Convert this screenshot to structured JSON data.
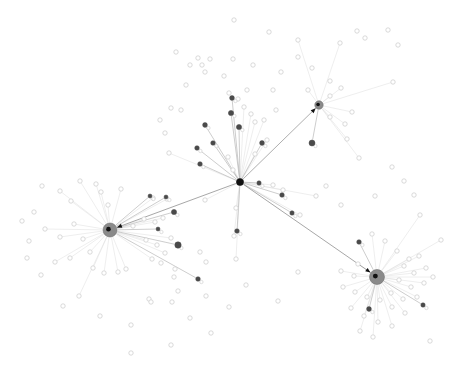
{
  "figure": {
    "title": "",
    "background": "#ffffff",
    "width": 453,
    "height": 379
  },
  "palette": {
    "hub_fill": "#8a8a8a",
    "hub_stroke": "#6f6f6f",
    "core_fill": "#111111",
    "dark_node_fill": "#4a4a4a",
    "mid_node_fill": "#9a9a9a",
    "leaf_stroke": "#cfcfcf",
    "leaf_fill": "#ffffff",
    "edge_strong": "#6b6b6b",
    "edge_medium": "#b8b8b8",
    "edge_faint": "#e0e0e0"
  },
  "chart_data": {
    "type": "scatter",
    "title": "",
    "xlabel": "",
    "ylabel": "",
    "xlim": [
      0,
      453
    ],
    "ylim": [
      0,
      379
    ],
    "grid": false,
    "legend": "none",
    "annotations": [],
    "node_counts": {
      "hubs": 4,
      "mid": 22,
      "leaves": 148
    },
    "hubs": [
      {
        "id": "H0",
        "label": "",
        "x": 240,
        "y": 182,
        "r": 3.6,
        "kind": "core",
        "degree": 34
      },
      {
        "id": "H1",
        "label": "",
        "x": 110,
        "y": 230,
        "r": 7.0,
        "kind": "hub",
        "degree": 24
      },
      {
        "id": "H2",
        "label": "",
        "x": 377,
        "y": 277,
        "r": 7.5,
        "kind": "hub",
        "degree": 33
      },
      {
        "id": "H3",
        "label": "",
        "x": 319,
        "y": 105,
        "r": 4.2,
        "kind": "hub",
        "degree": 7
      }
    ],
    "strong_edges": [
      {
        "source": "H0",
        "target": "H1",
        "weight": 3
      },
      {
        "source": "H0",
        "target": "H2",
        "weight": 3
      },
      {
        "source": "H0",
        "target": "H3",
        "weight": 2
      }
    ],
    "mid_nodes": [
      {
        "x": 205,
        "y": 125,
        "r": 2.4
      },
      {
        "x": 197,
        "y": 148,
        "r": 2.3
      },
      {
        "x": 213,
        "y": 143,
        "r": 2.3
      },
      {
        "x": 231,
        "y": 113,
        "r": 2.6
      },
      {
        "x": 232,
        "y": 98,
        "r": 2.4
      },
      {
        "x": 239,
        "y": 127,
        "r": 2.6
      },
      {
        "x": 262,
        "y": 143,
        "r": 2.4
      },
      {
        "x": 200,
        "y": 164,
        "r": 2.3
      },
      {
        "x": 259,
        "y": 183,
        "r": 2.2
      },
      {
        "x": 282,
        "y": 195,
        "r": 2.3
      },
      {
        "x": 312,
        "y": 143,
        "r": 3.0
      },
      {
        "x": 174,
        "y": 212,
        "r": 2.6
      },
      {
        "x": 178,
        "y": 245,
        "r": 3.2
      },
      {
        "x": 237,
        "y": 231,
        "r": 2.3
      },
      {
        "x": 198,
        "y": 279,
        "r": 2.3
      },
      {
        "x": 158,
        "y": 229,
        "r": 2.0
      },
      {
        "x": 292,
        "y": 213,
        "r": 2.2
      },
      {
        "x": 359,
        "y": 242,
        "r": 2.3
      },
      {
        "x": 369,
        "y": 309,
        "r": 2.4
      },
      {
        "x": 423,
        "y": 305,
        "r": 2.2
      },
      {
        "x": 166,
        "y": 197,
        "r": 2.0
      },
      {
        "x": 150,
        "y": 196,
        "r": 2.0
      }
    ],
    "leaf_nodes": [
      {
        "x": 234,
        "y": 20,
        "parent": "H0"
      },
      {
        "x": 269,
        "y": 32,
        "parent": "H0"
      },
      {
        "x": 176,
        "y": 52,
        "parent": "H0"
      },
      {
        "x": 198,
        "y": 58,
        "parent": "H0"
      },
      {
        "x": 202,
        "y": 65,
        "parent": "H0"
      },
      {
        "x": 210,
        "y": 59,
        "parent": "H0"
      },
      {
        "x": 190,
        "y": 65,
        "parent": "H0"
      },
      {
        "x": 233,
        "y": 59,
        "parent": "H0"
      },
      {
        "x": 253,
        "y": 65,
        "parent": "H0"
      },
      {
        "x": 205,
        "y": 72,
        "parent": "H0"
      },
      {
        "x": 224,
        "y": 76,
        "parent": "H0"
      },
      {
        "x": 186,
        "y": 85,
        "parent": "H0"
      },
      {
        "x": 171,
        "y": 108,
        "parent": "H0"
      },
      {
        "x": 181,
        "y": 110,
        "parent": "H0"
      },
      {
        "x": 160,
        "y": 120,
        "parent": "H0"
      },
      {
        "x": 165,
        "y": 133,
        "parent": "H0"
      },
      {
        "x": 169,
        "y": 153,
        "parent": "H0"
      },
      {
        "x": 229,
        "y": 93,
        "parent": "H0"
      },
      {
        "x": 238,
        "y": 99,
        "parent": "H0"
      },
      {
        "x": 247,
        "y": 90,
        "parent": "H0"
      },
      {
        "x": 244,
        "y": 107,
        "parent": "H0"
      },
      {
        "x": 251,
        "y": 114,
        "parent": "H0"
      },
      {
        "x": 255,
        "y": 122,
        "parent": "H0"
      },
      {
        "x": 264,
        "y": 120,
        "parent": "H0"
      },
      {
        "x": 276,
        "y": 110,
        "parent": "H0"
      },
      {
        "x": 273,
        "y": 90,
        "parent": "H0"
      },
      {
        "x": 281,
        "y": 72,
        "parent": "H0"
      },
      {
        "x": 298,
        "y": 57,
        "parent": "H0"
      },
      {
        "x": 312,
        "y": 68,
        "parent": "H0"
      },
      {
        "x": 330,
        "y": 81,
        "parent": "H0"
      },
      {
        "x": 340,
        "y": 43,
        "parent": "H3"
      },
      {
        "x": 357,
        "y": 31,
        "parent": "H3"
      },
      {
        "x": 365,
        "y": 38,
        "parent": "H3"
      },
      {
        "x": 388,
        "y": 30,
        "parent": "H3"
      },
      {
        "x": 298,
        "y": 40,
        "parent": "H3"
      },
      {
        "x": 308,
        "y": 90,
        "parent": "H3"
      },
      {
        "x": 330,
        "y": 96,
        "parent": "H3"
      },
      {
        "x": 341,
        "y": 88,
        "parent": "H3"
      },
      {
        "x": 330,
        "y": 117,
        "parent": "H3"
      },
      {
        "x": 345,
        "y": 124,
        "parent": "H3"
      },
      {
        "x": 352,
        "y": 112,
        "parent": "H3"
      },
      {
        "x": 347,
        "y": 139,
        "parent": "H3"
      },
      {
        "x": 359,
        "y": 158,
        "parent": "H3"
      },
      {
        "x": 393,
        "y": 82,
        "parent": "H3"
      },
      {
        "x": 398,
        "y": 45,
        "parent": "H3"
      },
      {
        "x": 255,
        "y": 154,
        "parent": "H0"
      },
      {
        "x": 267,
        "y": 140,
        "parent": "H0"
      },
      {
        "x": 228,
        "y": 157,
        "parent": "H0"
      },
      {
        "x": 233,
        "y": 170,
        "parent": "H0"
      },
      {
        "x": 273,
        "y": 185,
        "parent": "H0"
      },
      {
        "x": 283,
        "y": 190,
        "parent": "H0"
      },
      {
        "x": 300,
        "y": 215,
        "parent": "H0"
      },
      {
        "x": 234,
        "y": 236,
        "parent": "H0"
      },
      {
        "x": 236,
        "y": 208,
        "parent": "H0"
      },
      {
        "x": 205,
        "y": 200,
        "parent": "H0"
      },
      {
        "x": 167,
        "y": 199,
        "parent": "H1"
      },
      {
        "x": 153,
        "y": 198,
        "parent": "H1"
      },
      {
        "x": 144,
        "y": 219,
        "parent": "H1"
      },
      {
        "x": 155,
        "y": 222,
        "parent": "H1"
      },
      {
        "x": 163,
        "y": 218,
        "parent": "H1"
      },
      {
        "x": 133,
        "y": 226,
        "parent": "H1"
      },
      {
        "x": 146,
        "y": 240,
        "parent": "H1"
      },
      {
        "x": 157,
        "y": 245,
        "parent": "H1"
      },
      {
        "x": 171,
        "y": 238,
        "parent": "H1"
      },
      {
        "x": 165,
        "y": 253,
        "parent": "H1"
      },
      {
        "x": 152,
        "y": 259,
        "parent": "H1"
      },
      {
        "x": 96,
        "y": 184,
        "parent": "H1"
      },
      {
        "x": 80,
        "y": 181,
        "parent": "H1"
      },
      {
        "x": 101,
        "y": 192,
        "parent": "H1"
      },
      {
        "x": 71,
        "y": 201,
        "parent": "H1"
      },
      {
        "x": 60,
        "y": 191,
        "parent": "H1"
      },
      {
        "x": 42,
        "y": 186,
        "parent": "H1"
      },
      {
        "x": 34,
        "y": 212,
        "parent": "H1"
      },
      {
        "x": 22,
        "y": 221,
        "parent": "H1"
      },
      {
        "x": 29,
        "y": 241,
        "parent": "H1"
      },
      {
        "x": 45,
        "y": 229,
        "parent": "H1"
      },
      {
        "x": 60,
        "y": 237,
        "parent": "H1"
      },
      {
        "x": 74,
        "y": 224,
        "parent": "H1"
      },
      {
        "x": 83,
        "y": 239,
        "parent": "H1"
      },
      {
        "x": 90,
        "y": 252,
        "parent": "H1"
      },
      {
        "x": 70,
        "y": 258,
        "parent": "H1"
      },
      {
        "x": 55,
        "y": 262,
        "parent": "H1"
      },
      {
        "x": 41,
        "y": 275,
        "parent": "H1"
      },
      {
        "x": 27,
        "y": 258,
        "parent": "H1"
      },
      {
        "x": 93,
        "y": 268,
        "parent": "H1"
      },
      {
        "x": 104,
        "y": 273,
        "parent": "H1"
      },
      {
        "x": 118,
        "y": 272,
        "parent": "H1"
      },
      {
        "x": 126,
        "y": 269,
        "parent": "H1"
      },
      {
        "x": 108,
        "y": 205,
        "parent": "H1"
      },
      {
        "x": 121,
        "y": 189,
        "parent": "H1"
      },
      {
        "x": 63,
        "y": 306,
        "parent": "H1"
      },
      {
        "x": 79,
        "y": 296,
        "parent": "H1"
      },
      {
        "x": 100,
        "y": 316,
        "parent": "H1"
      },
      {
        "x": 131,
        "y": 325,
        "parent": "H1"
      },
      {
        "x": 149,
        "y": 299,
        "parent": "H1"
      },
      {
        "x": 151,
        "y": 302,
        "parent": "H1"
      },
      {
        "x": 172,
        "y": 302,
        "parent": "H1"
      },
      {
        "x": 178,
        "y": 291,
        "parent": "H1"
      },
      {
        "x": 190,
        "y": 318,
        "parent": "H1"
      },
      {
        "x": 206,
        "y": 296,
        "parent": "H1"
      },
      {
        "x": 131,
        "y": 353,
        "parent": "H1"
      },
      {
        "x": 171,
        "y": 345,
        "parent": "H1"
      },
      {
        "x": 211,
        "y": 333,
        "parent": "H1"
      },
      {
        "x": 229,
        "y": 307,
        "parent": "H0"
      },
      {
        "x": 200,
        "y": 252,
        "parent": "H0"
      },
      {
        "x": 206,
        "y": 262,
        "parent": "H0"
      },
      {
        "x": 175,
        "y": 269,
        "parent": "H0"
      },
      {
        "x": 174,
        "y": 277,
        "parent": "H0"
      },
      {
        "x": 161,
        "y": 263,
        "parent": "H0"
      },
      {
        "x": 246,
        "y": 285,
        "parent": "H0"
      },
      {
        "x": 278,
        "y": 301,
        "parent": "H0"
      },
      {
        "x": 236,
        "y": 259,
        "parent": "H0"
      },
      {
        "x": 298,
        "y": 272,
        "parent": "H0"
      },
      {
        "x": 316,
        "y": 196,
        "parent": "H0"
      },
      {
        "x": 326,
        "y": 186,
        "parent": "H0"
      },
      {
        "x": 341,
        "y": 205,
        "parent": "H0"
      },
      {
        "x": 375,
        "y": 196,
        "parent": "H2"
      },
      {
        "x": 392,
        "y": 167,
        "parent": "H2"
      },
      {
        "x": 404,
        "y": 181,
        "parent": "H2"
      },
      {
        "x": 414,
        "y": 195,
        "parent": "H2"
      },
      {
        "x": 420,
        "y": 215,
        "parent": "H2"
      },
      {
        "x": 372,
        "y": 234,
        "parent": "H2"
      },
      {
        "x": 385,
        "y": 241,
        "parent": "H2"
      },
      {
        "x": 397,
        "y": 251,
        "parent": "H2"
      },
      {
        "x": 409,
        "y": 259,
        "parent": "H2"
      },
      {
        "x": 419,
        "y": 256,
        "parent": "H2"
      },
      {
        "x": 404,
        "y": 266,
        "parent": "H2"
      },
      {
        "x": 414,
        "y": 273,
        "parent": "H2"
      },
      {
        "x": 426,
        "y": 268,
        "parent": "H2"
      },
      {
        "x": 399,
        "y": 280,
        "parent": "H2"
      },
      {
        "x": 411,
        "y": 287,
        "parent": "H2"
      },
      {
        "x": 424,
        "y": 283,
        "parent": "H2"
      },
      {
        "x": 433,
        "y": 277,
        "parent": "H2"
      },
      {
        "x": 391,
        "y": 293,
        "parent": "H2"
      },
      {
        "x": 403,
        "y": 299,
        "parent": "H2"
      },
      {
        "x": 417,
        "y": 297,
        "parent": "H2"
      },
      {
        "x": 380,
        "y": 300,
        "parent": "H2"
      },
      {
        "x": 392,
        "y": 307,
        "parent": "H2"
      },
      {
        "x": 405,
        "y": 313,
        "parent": "H2"
      },
      {
        "x": 367,
        "y": 297,
        "parent": "H2"
      },
      {
        "x": 355,
        "y": 292,
        "parent": "H2"
      },
      {
        "x": 343,
        "y": 287,
        "parent": "H2"
      },
      {
        "x": 354,
        "y": 276,
        "parent": "H2"
      },
      {
        "x": 341,
        "y": 271,
        "parent": "H2"
      },
      {
        "x": 358,
        "y": 264,
        "parent": "H2"
      },
      {
        "x": 351,
        "y": 308,
        "parent": "H2"
      },
      {
        "x": 364,
        "y": 316,
        "parent": "H2"
      },
      {
        "x": 378,
        "y": 322,
        "parent": "H2"
      },
      {
        "x": 392,
        "y": 326,
        "parent": "H2"
      },
      {
        "x": 360,
        "y": 331,
        "parent": "H2"
      },
      {
        "x": 373,
        "y": 337,
        "parent": "H2"
      },
      {
        "x": 430,
        "y": 341,
        "parent": "H2"
      },
      {
        "x": 441,
        "y": 240,
        "parent": "H2"
      }
    ]
  }
}
